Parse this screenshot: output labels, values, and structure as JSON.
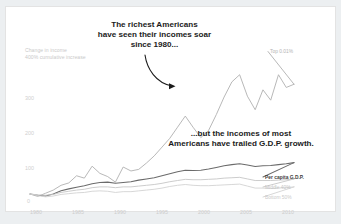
{
  "card": {
    "background": "#ffffff",
    "page_background": "#eceff1",
    "border_color": "#e3e3e3"
  },
  "annotations": {
    "headline": {
      "line1": "The richest Americans",
      "line2": "have seen their incomes soar",
      "line3": "since 1980..."
    },
    "secondary": {
      "line1": "...but the incomes of most",
      "line2": "Americans have trailed G.D.P. growth."
    }
  },
  "chart_data": {
    "type": "line",
    "title": "",
    "subtitle": "",
    "axis_title_line1": "Change in income",
    "axis_title_line2": "400% cumulative increase",
    "xlabel": "",
    "ylabel": "Change in income",
    "xlim": [
      1980,
      2014
    ],
    "ylim": [
      -20,
      420
    ],
    "yticks": [
      0,
      100,
      200,
      300
    ],
    "ytick_labels": [
      "0",
      "100",
      "200",
      "300"
    ],
    "xticks": [
      1980,
      1985,
      1990,
      1995,
      2000,
      2005,
      2010
    ],
    "xtick_labels": [
      "1980",
      "1985",
      "1990",
      "1995",
      "2000",
      "2005",
      "2010"
    ],
    "grid": false,
    "legend_position": "right-inline",
    "x": [
      1980,
      1981,
      1982,
      1983,
      1984,
      1985,
      1986,
      1987,
      1988,
      1989,
      1990,
      1991,
      1992,
      1993,
      1994,
      1995,
      1996,
      1997,
      1998,
      1999,
      2000,
      2001,
      2002,
      2003,
      2004,
      2005,
      2006,
      2007,
      2008,
      2009,
      2010,
      2011,
      2012,
      2013,
      2014
    ],
    "series": [
      {
        "name": "Top 0.01%",
        "label": "Top 0.01%",
        "color": "#b0b0b0",
        "width": 0.9,
        "values": [
          0,
          -6,
          2,
          10,
          22,
          28,
          46,
          40,
          70,
          52,
          44,
          30,
          68,
          58,
          62,
          78,
          96,
          118,
          140,
          168,
          196,
          168,
          142,
          160,
          200,
          244,
          282,
          300,
          246,
          212,
          262,
          236,
          300,
          268,
          276
        ]
      },
      {
        "name": "Per capita G.D.P.",
        "label": "Per capita G.D.P.",
        "color": "#6b6b6b",
        "width": 1.05,
        "values": [
          0,
          -3,
          -5,
          0,
          8,
          13,
          17,
          21,
          26,
          29,
          30,
          27,
          29,
          31,
          35,
          38,
          41,
          46,
          51,
          56,
          60,
          59,
          60,
          63,
          67,
          71,
          74,
          76,
          73,
          69,
          71,
          72,
          74,
          76,
          79
        ]
      },
      {
        "name": "Middle 40%",
        "label": "Middle 40%",
        "color": "#c6c6c6",
        "width": 0.9,
        "values": [
          0,
          -2,
          -3,
          -1,
          4,
          7,
          10,
          12,
          16,
          18,
          18,
          16,
          18,
          18,
          20,
          22,
          24,
          27,
          31,
          34,
          37,
          36,
          36,
          37,
          38,
          40,
          41,
          42,
          38,
          34,
          34,
          34,
          35,
          36,
          38
        ]
      },
      {
        "name": "Bottom 50%",
        "label": "Bottom 50%",
        "color": "#d2d2d2",
        "width": 0.9,
        "values": [
          0,
          -4,
          -7,
          -5,
          -1,
          1,
          3,
          4,
          7,
          8,
          7,
          4,
          6,
          6,
          8,
          10,
          12,
          15,
          19,
          22,
          24,
          22,
          21,
          21,
          22,
          23,
          24,
          25,
          20,
          15,
          15,
          14,
          15,
          16,
          18
        ]
      }
    ]
  }
}
